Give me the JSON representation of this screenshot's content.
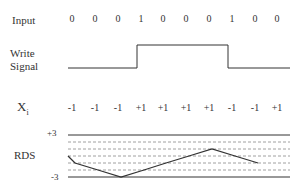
{
  "labels": {
    "input": "Input",
    "write_line1": "Write",
    "write_line2": "Signal",
    "xi_main": "X",
    "xi_sub": "i",
    "rds": "RDS",
    "rds_top": "+3",
    "rds_bottom": "-3"
  },
  "columns_x": [
    72,
    95,
    118,
    141,
    163,
    186,
    209,
    232,
    255,
    277
  ],
  "input_bits": [
    "0",
    "0",
    "0",
    "1",
    "0",
    "0",
    "0",
    "1",
    "0",
    "0"
  ],
  "xi_values": [
    "-1",
    "-1",
    "-1",
    "+1",
    "+1",
    "+1",
    "+1",
    "-1",
    "-1",
    "+1"
  ],
  "rds_levels": [
    0,
    -1,
    -2,
    -3,
    -2,
    -1,
    0,
    1,
    0,
    -1
  ],
  "colors": {
    "line": "#333333",
    "grid": "#888888",
    "text": "#333333"
  }
}
